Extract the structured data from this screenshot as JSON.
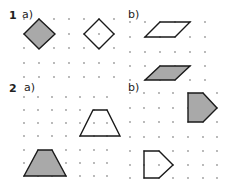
{
  "labels": {
    "q1": "1",
    "q1a": "a)",
    "q1b": "b)",
    "q2": "2",
    "q2a": "a)",
    "q2b": "b)"
  },
  "colors": {
    "fill": "#a9a9a9",
    "stroke": "#1a1a1a",
    "dot": "#9a9a9a"
  },
  "grids": [
    {
      "id": "1a",
      "xs": [
        24,
        39,
        54,
        69,
        84,
        99,
        114
      ],
      "ys": [
        19,
        34,
        48,
        63,
        77
      ]
    },
    {
      "id": "1b",
      "xs": [
        130,
        145,
        160,
        175,
        190,
        205
      ],
      "ys": [
        22,
        37,
        52,
        66,
        80
      ]
    },
    {
      "id": "2a",
      "xs": [
        24,
        38,
        52,
        66,
        80,
        94,
        107
      ],
      "ys": [
        97,
        110,
        123,
        136,
        150,
        163,
        176
      ]
    },
    {
      "id": "2b",
      "xs": [
        130,
        144,
        159,
        173,
        188,
        203,
        217
      ],
      "ys": [
        93,
        108,
        122,
        137,
        151,
        165,
        178
      ]
    }
  ],
  "shapes": [
    {
      "name": "square-1a-shaded",
      "points": "24,34 39,19 55,34 39,49",
      "filled": true
    },
    {
      "name": "square-1a-outline",
      "points": "84,34 99,19 114,34 99,49",
      "filled": false
    },
    {
      "name": "parallelogram-1b-outline",
      "points": "145,37 160,22 190,22 175,37",
      "filled": false
    },
    {
      "name": "parallelogram-1b-shaded",
      "points": "145,80 160,66 190,66 175,80",
      "filled": true
    },
    {
      "name": "trapezoid-2a-outline",
      "points": "80,136 93,110 107,110 120,136",
      "filled": false
    },
    {
      "name": "trapezoid-2a-shaded",
      "points": "24,176 38,150 52,150 66,176",
      "filled": true
    },
    {
      "name": "pentagon-2b-shaded",
      "points": "188,93 203,93 217,108 203,122 188,122",
      "filled": true
    },
    {
      "name": "pentagon-2b-outline",
      "points": "144,151 159,151 173,165 159,178 144,178",
      "filled": false
    }
  ]
}
